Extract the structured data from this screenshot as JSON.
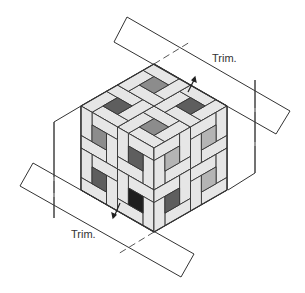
{
  "diagram": {
    "type": "quilt-assembly",
    "labels": {
      "trim_top": "Trim.",
      "trim_bottom": "Trim."
    },
    "colors": {
      "outline": "#333333",
      "frame": "#e6e6e6",
      "center_dark": "#5e5e5e",
      "center_medium": "#8c8c8c",
      "center_light": "#b4b4b4",
      "center_black": "#1e1e1e"
    }
  }
}
